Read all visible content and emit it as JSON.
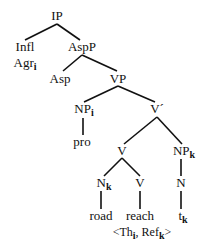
{
  "diagram": {
    "type": "syntax-tree",
    "nodes": [
      {
        "id": "IP",
        "label": "IP",
        "sub": "",
        "x": 55,
        "y": 10
      },
      {
        "id": "Infl",
        "label": "Infl",
        "sub": "",
        "x": 22,
        "y": 41
      },
      {
        "id": "Agr",
        "label": "Agr",
        "sub": "i",
        "x": 22,
        "y": 58
      },
      {
        "id": "AspP",
        "label": "AspP",
        "sub": "",
        "x": 80,
        "y": 41
      },
      {
        "id": "Asp",
        "label": "Asp",
        "sub": "",
        "x": 60,
        "y": 72
      },
      {
        "id": "VP",
        "label": "VP",
        "sub": "",
        "x": 117,
        "y": 72
      },
      {
        "id": "NP_i",
        "label": "NP",
        "sub": "i",
        "x": 83,
        "y": 103
      },
      {
        "id": "Vbar",
        "label": "V´",
        "sub": "",
        "x": 155,
        "y": 103
      },
      {
        "id": "pro",
        "label": "pro",
        "sub": "",
        "x": 81,
        "y": 135
      },
      {
        "id": "V1",
        "label": "V",
        "sub": "",
        "x": 122,
        "y": 145
      },
      {
        "id": "NP_k",
        "label": "NP",
        "sub": "k",
        "x": 182,
        "y": 145
      },
      {
        "id": "N_k",
        "label": "N",
        "sub": "k",
        "x": 103,
        "y": 177
      },
      {
        "id": "V2",
        "label": "V",
        "sub": "",
        "x": 140,
        "y": 177
      },
      {
        "id": "N",
        "label": "N",
        "sub": "",
        "x": 181,
        "y": 177
      },
      {
        "id": "road",
        "label": "road",
        "sub": "",
        "x": 101,
        "y": 210
      },
      {
        "id": "reach",
        "label": "reach",
        "sub": "",
        "x": 140,
        "y": 210
      },
      {
        "id": "t_k",
        "label": "t",
        "sub": "k",
        "x": 182,
        "y": 210
      },
      {
        "id": "grid",
        "label": "<Th",
        "sub": "i",
        "x": 140,
        "y": 226,
        "suffix": ", Ref",
        "suffix_sub": "k",
        "end": ">"
      }
    ],
    "edges": [
      [
        "IP",
        "Infl"
      ],
      [
        "IP",
        "AspP"
      ],
      [
        "AspP",
        "Asp"
      ],
      [
        "AspP",
        "VP"
      ],
      [
        "VP",
        "NP_i"
      ],
      [
        "VP",
        "Vbar"
      ],
      [
        "NP_i",
        "pro"
      ],
      [
        "Vbar",
        "V1"
      ],
      [
        "Vbar",
        "NP_k"
      ],
      [
        "V1",
        "N_k"
      ],
      [
        "V1",
        "V2"
      ],
      [
        "N_k",
        "road"
      ],
      [
        "V2",
        "reach"
      ],
      [
        "NP_k",
        "N"
      ],
      [
        "N",
        "t_k"
      ]
    ]
  }
}
